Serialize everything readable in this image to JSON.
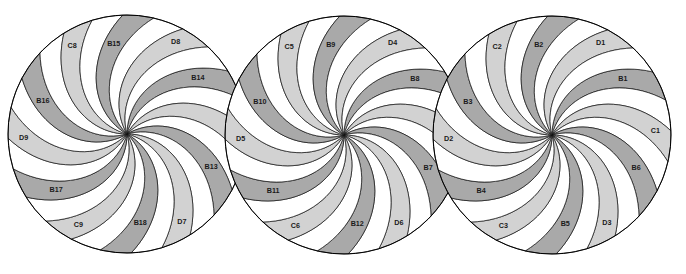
{
  "figure": {
    "title": "",
    "type": "pinwheel-spiral-diagram",
    "background_color": "#ffffff",
    "outline_color": "#000000",
    "colors": {
      "dark_band": "#a9a9a9",
      "light_band": "#d2d2d2",
      "white_band": "#ffffff",
      "stroke": "#111111",
      "label_text": "#1a1a1a"
    },
    "geometry": {
      "canvas_width": 686,
      "canvas_height": 274,
      "radius": 119,
      "bands_per_circle": 24,
      "arms": 6,
      "spiral_twist_degrees": 58
    }
  },
  "circles": [
    {
      "id": "circle-left",
      "index": 1,
      "cx": 127,
      "cy": 134,
      "r": 119,
      "arms": [
        {
          "dark": "B14",
          "light": "C7"
        },
        {
          "dark": "B13",
          "light": "D7"
        },
        {
          "dark": "B18",
          "light": "C9"
        },
        {
          "dark": "B17",
          "light": "D9"
        },
        {
          "dark": "B16",
          "light": "C8"
        },
        {
          "dark": "B15",
          "light": "D8"
        }
      ]
    },
    {
      "id": "circle-middle",
      "index": 2,
      "cx": 344,
      "cy": 135,
      "r": 119,
      "arms": [
        {
          "dark": "B8",
          "light": "C4"
        },
        {
          "dark": "B7",
          "light": "D6"
        },
        {
          "dark": "B12",
          "light": "C6"
        },
        {
          "dark": "B11",
          "light": "D5"
        },
        {
          "dark": "B10",
          "light": "C5"
        },
        {
          "dark": "B9",
          "light": "D4"
        }
      ]
    },
    {
      "id": "circle-right",
      "index": 3,
      "cx": 552,
      "cy": 135,
      "r": 119,
      "arms": [
        {
          "dark": "B1",
          "light": "C1"
        },
        {
          "dark": "B6",
          "light": "D3"
        },
        {
          "dark": "B5",
          "light": "C3"
        },
        {
          "dark": "B4",
          "light": "D2"
        },
        {
          "dark": "B3",
          "light": "C2"
        },
        {
          "dark": "B2",
          "light": "D1"
        }
      ]
    }
  ]
}
